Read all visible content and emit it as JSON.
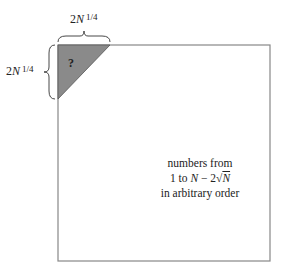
{
  "diagram": {
    "top_label": {
      "coef": "2",
      "var": "N",
      "exp": "1/4"
    },
    "left_label": {
      "coef": "2",
      "var": "N",
      "exp": "1/4"
    },
    "triangle_label": "?",
    "center_text": {
      "line1": "numbers from",
      "line2_prefix": "1 to ",
      "line2_var": "N",
      "line2_mid": " − 2√",
      "line2_var2": "N",
      "line3": "in arbitrary order"
    },
    "colors": {
      "triangle_fill": "#8a8a8a",
      "border": "#888888"
    }
  }
}
